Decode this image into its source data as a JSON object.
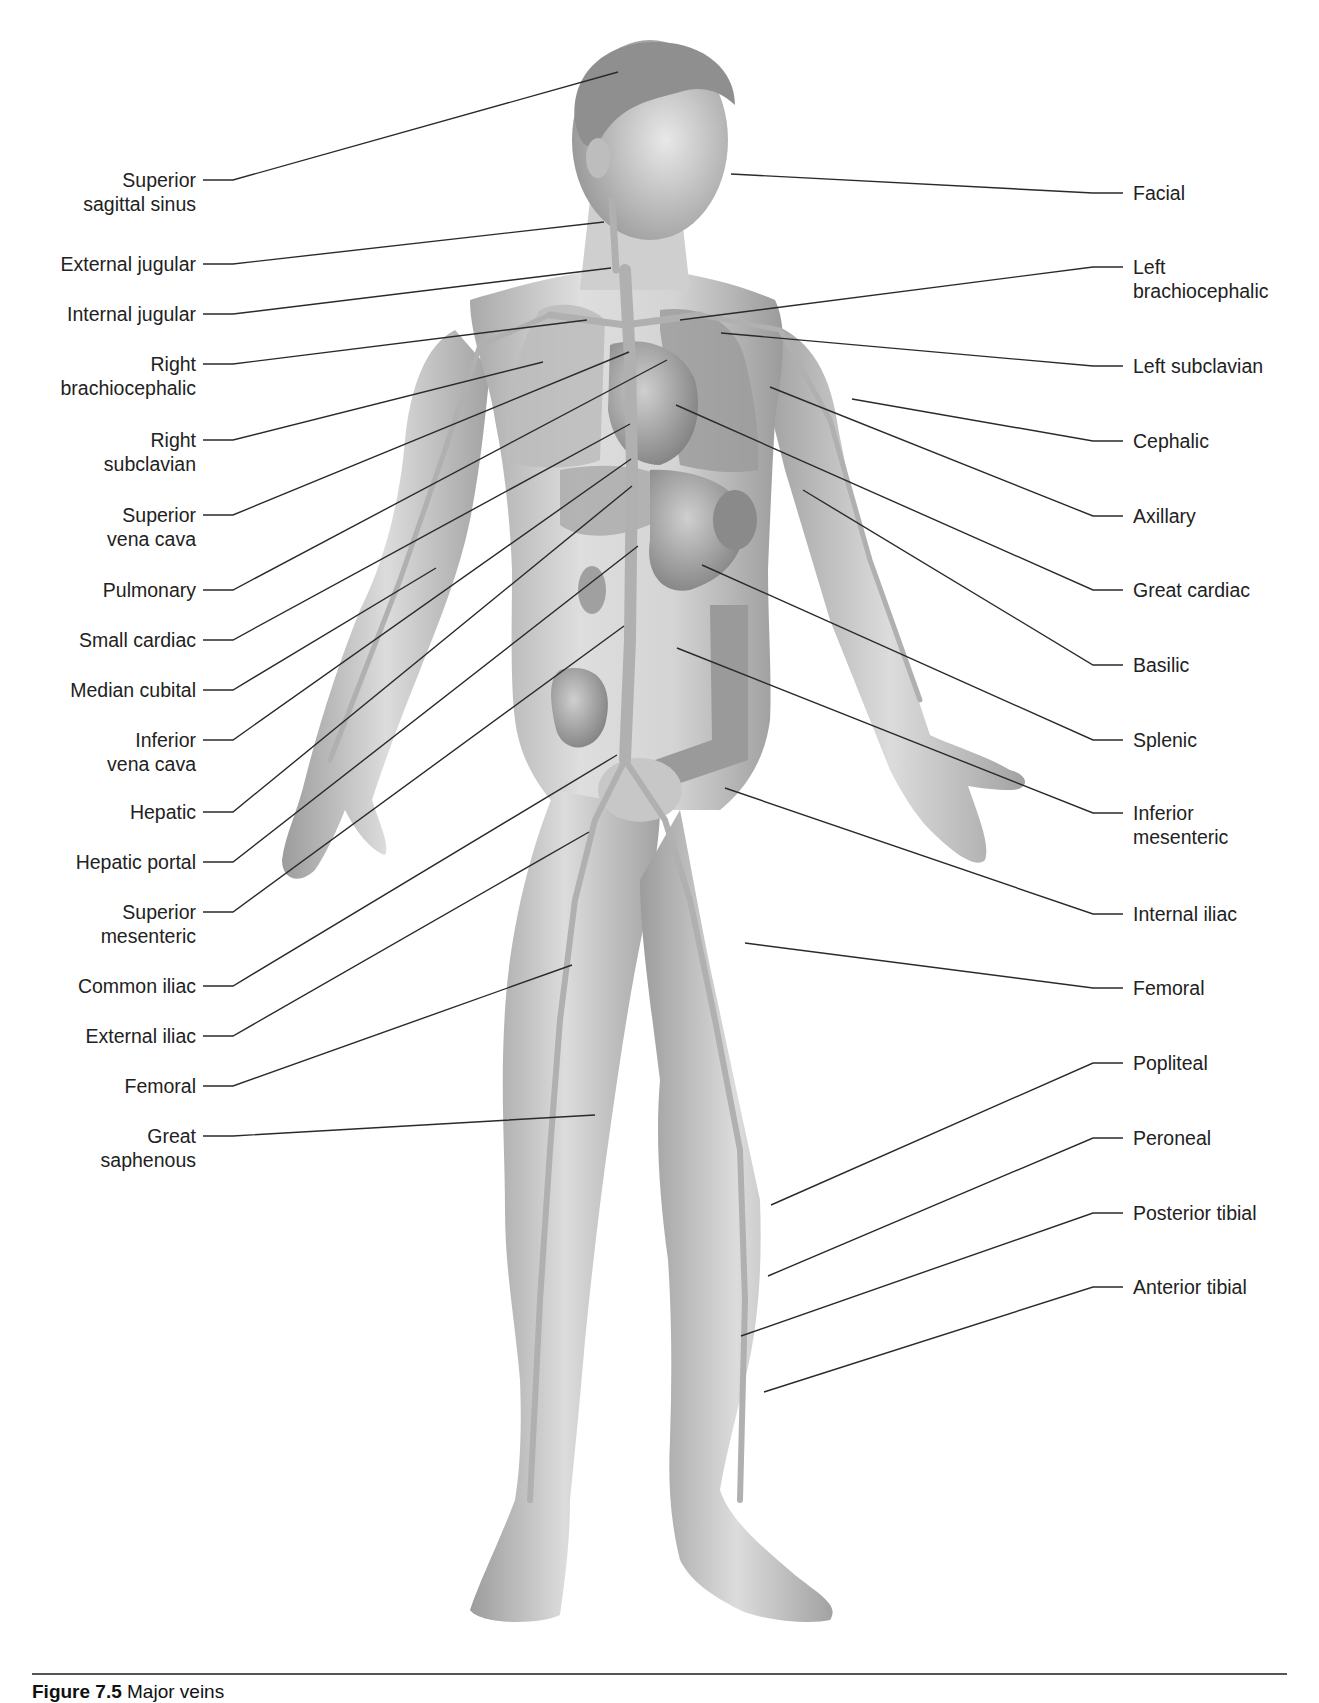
{
  "figure": {
    "caption_prefix": "Figure 7.5",
    "caption_text": "Major veins"
  },
  "labels_left": [
    {
      "id": "superior-sagittal-sinus",
      "text": "Superior\nsagittal sinus",
      "y": 180,
      "target": [
        618,
        72
      ]
    },
    {
      "id": "external-jugular",
      "text": "External jugular",
      "y": 264,
      "target": [
        604,
        222
      ]
    },
    {
      "id": "internal-jugular",
      "text": "Internal jugular",
      "y": 314,
      "target": [
        611,
        268
      ]
    },
    {
      "id": "right-brachiocephalic",
      "text": "Right\nbrachiocephalic",
      "y": 364,
      "target": [
        587,
        320
      ]
    },
    {
      "id": "right-subclavian",
      "text": "Right\nsubclavian",
      "y": 440,
      "target": [
        543,
        362
      ]
    },
    {
      "id": "superior-vena-cava",
      "text": "Superior\nvena cava",
      "y": 515,
      "target": [
        629,
        352
      ]
    },
    {
      "id": "pulmonary",
      "text": "Pulmonary",
      "y": 590,
      "target": [
        667,
        360
      ]
    },
    {
      "id": "small-cardiac",
      "text": "Small cardiac",
      "y": 640,
      "target": [
        630,
        424
      ]
    },
    {
      "id": "median-cubital",
      "text": "Median cubital",
      "y": 690,
      "target": [
        436,
        568
      ]
    },
    {
      "id": "inferior-vena-cava",
      "text": "Inferior\nvena cava",
      "y": 740,
      "target": [
        631,
        459
      ]
    },
    {
      "id": "hepatic",
      "text": "Hepatic",
      "y": 812,
      "target": [
        632,
        486
      ]
    },
    {
      "id": "hepatic-portal",
      "text": "Hepatic portal",
      "y": 862,
      "target": [
        638,
        546
      ]
    },
    {
      "id": "superior-mesenteric",
      "text": "Superior\nmesenteric",
      "y": 912,
      "target": [
        624,
        626
      ]
    },
    {
      "id": "common-iliac",
      "text": "Common iliac",
      "y": 986,
      "target": [
        617,
        755
      ]
    },
    {
      "id": "external-iliac",
      "text": "External iliac",
      "y": 1036,
      "target": [
        589,
        832
      ]
    },
    {
      "id": "femoral-left",
      "text": "Femoral",
      "y": 1086,
      "target": [
        572,
        965
      ]
    },
    {
      "id": "great-saphenous",
      "text": "Great\nsaphenous",
      "y": 1136,
      "target": [
        595,
        1115
      ]
    }
  ],
  "labels_right": [
    {
      "id": "facial",
      "text": "Facial",
      "y": 193,
      "target": [
        731,
        174
      ]
    },
    {
      "id": "left-brachiocephalic",
      "text": "Left\nbrachiocephalic",
      "y": 267,
      "target": [
        680,
        320
      ]
    },
    {
      "id": "left-subclavian",
      "text": "Left subclavian",
      "y": 366,
      "target": [
        721,
        333
      ]
    },
    {
      "id": "cephalic",
      "text": "Cephalic",
      "y": 441,
      "target": [
        852,
        399
      ]
    },
    {
      "id": "axillary",
      "text": "Axillary",
      "y": 516,
      "target": [
        770,
        387
      ]
    },
    {
      "id": "great-cardiac",
      "text": "Great cardiac",
      "y": 590,
      "target": [
        676,
        405
      ]
    },
    {
      "id": "basilic",
      "text": "Basilic",
      "y": 665,
      "target": [
        803,
        490
      ]
    },
    {
      "id": "splenic",
      "text": "Splenic",
      "y": 740,
      "target": [
        702,
        565
      ]
    },
    {
      "id": "inferior-mesenteric",
      "text": "Inferior\nmesenteric",
      "y": 813,
      "target": [
        677,
        648
      ]
    },
    {
      "id": "internal-iliac",
      "text": "Internal iliac",
      "y": 914,
      "target": [
        725,
        788
      ]
    },
    {
      "id": "femoral-right",
      "text": "Femoral",
      "y": 988,
      "target": [
        745,
        943
      ]
    },
    {
      "id": "popliteal",
      "text": "Popliteal",
      "y": 1063,
      "target": [
        771,
        1205
      ]
    },
    {
      "id": "peroneal",
      "text": "Peroneal",
      "y": 1138,
      "target": [
        768,
        1276
      ]
    },
    {
      "id": "posterior-tibial",
      "text": "Posterior tibial",
      "y": 1213,
      "target": [
        741,
        1336
      ]
    },
    {
      "id": "anterior-tibial",
      "text": "Anterior tibial",
      "y": 1287,
      "target": [
        764,
        1392
      ]
    }
  ],
  "colors": {
    "background": "#ffffff",
    "label_text": "#222222",
    "leader_line": "#2a2a2a",
    "skin_light": "#e4e4e4",
    "skin_mid": "#c4c4c4",
    "skin_dark": "#8e8e8e",
    "vein": "#b0b0b0",
    "organ": "#a8a8a8",
    "rule": "#555555"
  }
}
